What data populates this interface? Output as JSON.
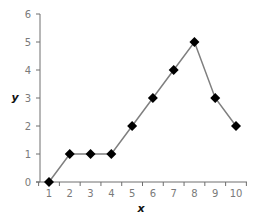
{
  "chart_data": {
    "type": "line",
    "title": "",
    "xlabel": "x",
    "ylabel": "y",
    "x": [
      1,
      2,
      3,
      4,
      5,
      6,
      7,
      8,
      9,
      10
    ],
    "categories": [
      "1",
      "2",
      "3",
      "4",
      "5",
      "6",
      "7",
      "8",
      "9",
      "10"
    ],
    "series": [
      {
        "name": "y",
        "values": [
          0,
          1,
          1,
          1,
          2,
          3,
          4,
          5,
          3,
          2
        ],
        "marker": "diamond"
      }
    ],
    "ylim": [
      0,
      6
    ],
    "yticks": [
      0,
      1,
      2,
      3,
      4,
      5,
      6
    ],
    "grid": false,
    "legend": "none"
  },
  "colors": {
    "axis": "#6e6e6e",
    "line": "#7f7f7f",
    "marker": "#000000",
    "tick_label": "#7a7a7a",
    "axis_title": "#111111"
  }
}
